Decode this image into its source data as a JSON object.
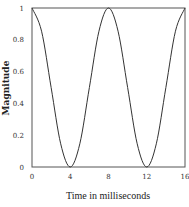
{
  "chart_data": {
    "type": "line",
    "title": "",
    "xlabel": "Time in milliseconds",
    "ylabel": "Magnitude",
    "xlim": [
      0,
      16
    ],
    "ylim": [
      0,
      1
    ],
    "xticks": [
      "0",
      "4",
      "8",
      "12",
      "16"
    ],
    "yticks": [
      "0",
      "0.2",
      "0.4",
      "0.6",
      "0.8",
      "1"
    ],
    "grid": false,
    "legend": "none",
    "series": [
      {
        "name": "magnitude",
        "x": [
          0,
          1,
          2,
          3,
          4,
          5,
          6,
          7,
          8,
          9,
          10,
          11,
          12,
          13,
          14,
          15,
          16
        ],
        "values": [
          1,
          0.854,
          0.5,
          0.146,
          0,
          0.146,
          0.5,
          0.854,
          1,
          0.854,
          0.5,
          0.146,
          0,
          0.146,
          0.5,
          0.854,
          1
        ]
      }
    ]
  }
}
